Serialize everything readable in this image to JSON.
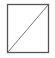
{
  "icon": {
    "name": "empty-slash-box-icon",
    "stroke_color": "#555555",
    "background": "#ffffff"
  }
}
